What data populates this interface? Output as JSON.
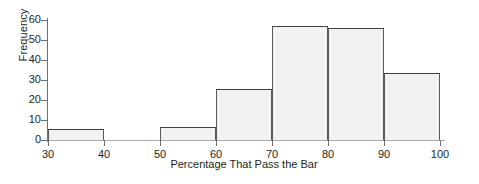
{
  "chart_data": {
    "type": "bar",
    "subtype": "histogram",
    "title": "",
    "xlabel": "Percentage That Pass the Bar",
    "ylabel": "Frequency",
    "xlim": [
      30,
      100
    ],
    "ylim": [
      0,
      60
    ],
    "grid": false,
    "legend": null,
    "bin_width": 10,
    "x_ticks": [
      30,
      40,
      50,
      60,
      70,
      80,
      90,
      100
    ],
    "y_ticks": [
      0,
      10,
      20,
      30,
      40,
      50,
      60
    ],
    "bins": [
      {
        "label": "30-40",
        "x0": 30,
        "x1": 40,
        "value": 5.5
      },
      {
        "label": "40-50",
        "x0": 40,
        "x1": 50,
        "value": 0
      },
      {
        "label": "50-60",
        "x0": 50,
        "x1": 60,
        "value": 6.5
      },
      {
        "label": "60-70",
        "x0": 60,
        "x1": 70,
        "value": 25.5
      },
      {
        "label": "70-80",
        "x0": 70,
        "x1": 80,
        "value": 57
      },
      {
        "label": "80-90",
        "x0": 80,
        "x1": 90,
        "value": 56
      },
      {
        "label": "90-100",
        "x0": 90,
        "x1": 100,
        "value": 33.5
      }
    ],
    "categories": [
      "30-40",
      "40-50",
      "50-60",
      "60-70",
      "70-80",
      "80-90",
      "90-100"
    ],
    "values": [
      5.5,
      0,
      6.5,
      25.5,
      57,
      56,
      33.5
    ],
    "colors": {
      "bar_fill": "#f2f2f2",
      "bar_stroke": "#58595b",
      "axis": "#6d6e71",
      "text": "#231f20",
      "background": "#ffffff"
    }
  }
}
